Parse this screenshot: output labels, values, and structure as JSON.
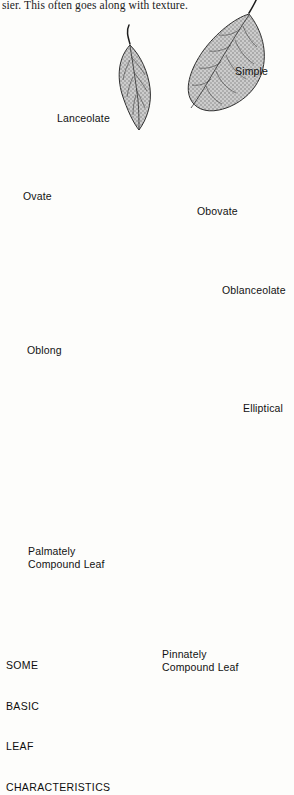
{
  "page": {
    "body_text": "sier. This often goes along with texture.",
    "caption_lines": [
      "SOME",
      "BASIC",
      "LEAF",
      "CHARACTERISTICS"
    ],
    "background_color": "#fdfdfb",
    "ink_color": "#1d1d1d",
    "leaf_fill_color": "#b9b9b9"
  },
  "figure": {
    "title": "SOME BASIC LEAF CHARACTERISTICS",
    "type": "botanical-illustration",
    "specimen_count": 8,
    "labels": {
      "simple": "Simple",
      "lanceolate": "Lanceolate",
      "ovate": "Ovate",
      "obovate": "Obovate",
      "oblanceolate": "Oblanceolate",
      "oblong": "Oblong",
      "elliptical": "Elliptical",
      "palmately_compound": "Palmately\nCompound Leaf",
      "palmately_compound_l1": "Palmately",
      "palmately_compound_l2": "Compound Leaf",
      "pinnately_compound_l1": "Pinnately",
      "pinnately_compound_l2": "Compound Leaf"
    },
    "specimens": [
      {
        "name": "Simple",
        "label": "Simple",
        "leaf_class": "simple",
        "description": "broad ovate-elliptic blade with prominent pinnate venation"
      },
      {
        "name": "Lanceolate",
        "label": "Lanceolate",
        "leaf_class": "simple",
        "description": "narrow, widest below middle, tapering to a point"
      },
      {
        "name": "Ovate",
        "label": "Ovate",
        "leaf_class": "simple",
        "description": "egg-shaped, widest near the base"
      },
      {
        "name": "Obovate",
        "label": "Obovate",
        "leaf_class": "simple",
        "description": "inversely egg-shaped, widest above middle"
      },
      {
        "name": "Oblanceolate",
        "label": "Oblanceolate",
        "leaf_class": "simple",
        "description": "inversely lanceolate, widest toward the tip"
      },
      {
        "name": "Oblong",
        "label": "Oblong",
        "leaf_class": "simple",
        "description": "narrow with nearly parallel sides and rounded ends"
      },
      {
        "name": "Elliptical",
        "label": "Elliptical",
        "leaf_class": "simple",
        "description": "widest at the middle, tapering equally to both ends"
      },
      {
        "name": "Palmately Compound Leaf",
        "label": "Palmately Compound Leaf",
        "leaf_class": "compound",
        "description": "leaflets radiate from a single central point",
        "leaflet_count": 6
      },
      {
        "name": "Pinnately Compound Leaf",
        "label": "Pinnately Compound Leaf",
        "leaf_class": "compound",
        "description": "leaflets arranged in pairs along a central rachis",
        "leaflet_count": 13
      }
    ]
  }
}
